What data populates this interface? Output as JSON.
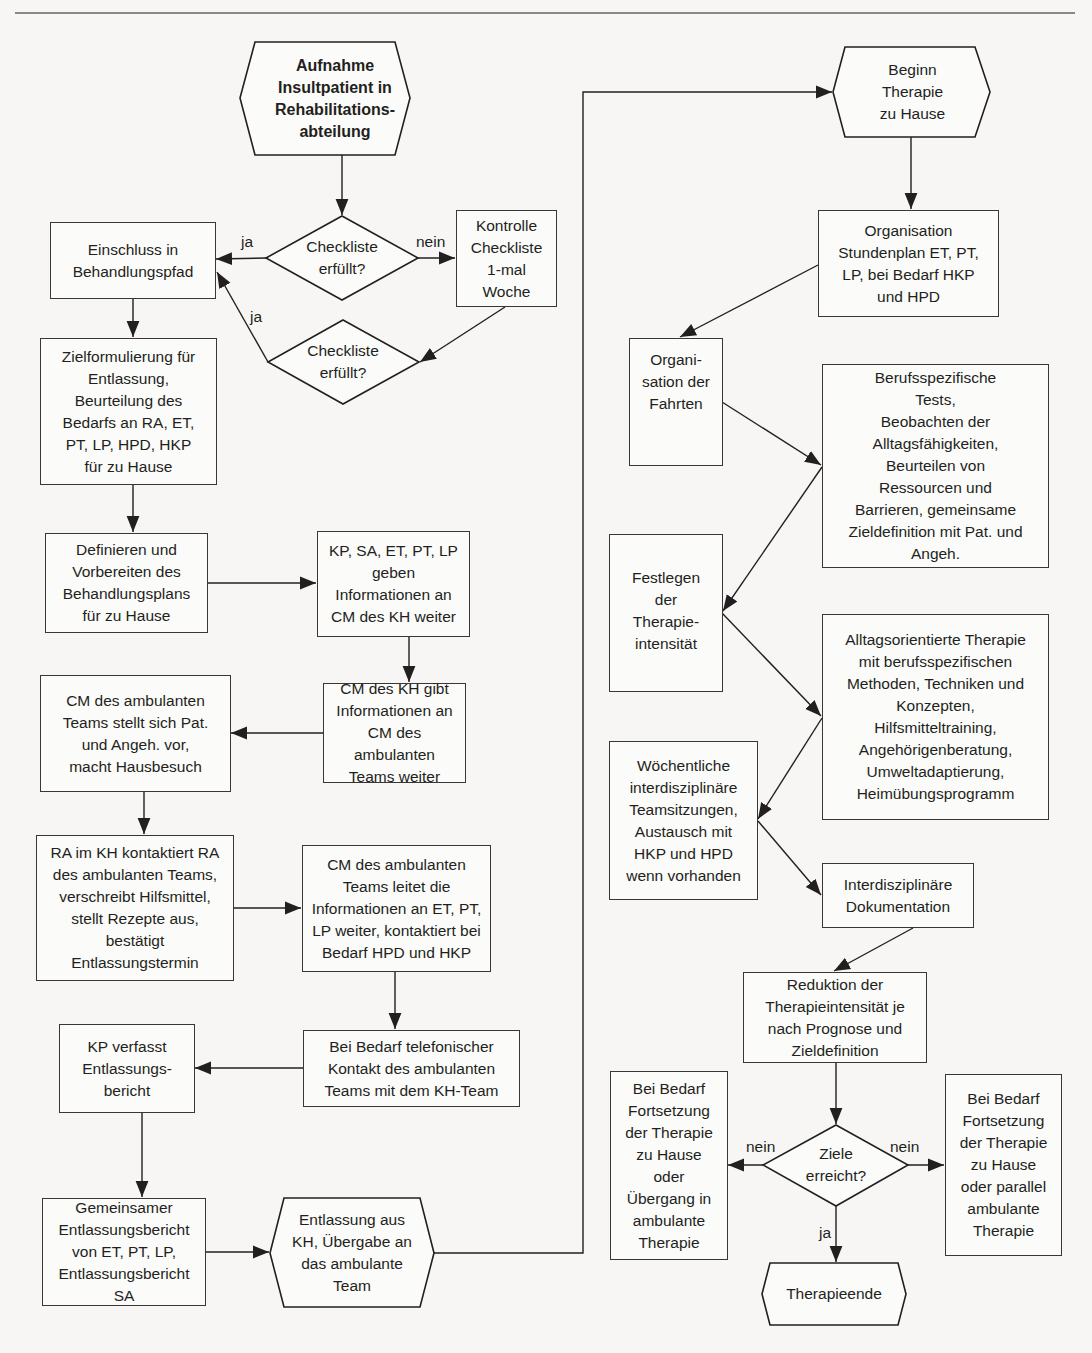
{
  "colors": {
    "line": "#231f20",
    "box_fill": "#fbfbfa",
    "background": "#f7f6f4",
    "rule": "#8a8886"
  },
  "left_column": {
    "start": "Aufnahme\nInsultpatient in\nRehabilitations-\nabteilung",
    "decision_1": "Checkliste\nerfüllt?",
    "control": "Kontrolle\nCheckliste\n1-mal\nWoche",
    "decision_2": "Checkliste\nerfüllt?",
    "inclusion": "Einschluss in\nBehandlungspfad",
    "goal_formulation": "Zielformulierung für\nEntlassung,\nBeurteilung des\nBedarfs an RA, ET,\nPT, LP, HPD, HKP\nfür zu Hause",
    "define_plan": "Definieren und\nVorbereiten des\nBehandlungsplans\nfür zu Hause",
    "info_to_cm": "KP, SA, ET, PT, LP\ngeben\nInformationen an\nCM des KH weiter",
    "cm_kh_info": "CM des KH gibt\nInformationen an\nCM des ambulanten\nTeams weiter",
    "cm_amb_visit": "CM des ambulanten\nTeams stellt sich Pat.\nund Angeh. vor,\nmacht Hausbesuch",
    "ra_contact": "RA im KH kontaktiert RA\ndes ambulanten Teams,\nverschreibt Hilfsmittel,\nstellt Rezepte aus,\nbestätigt\nEntlassungstermin",
    "cm_amb_forward": "CM des ambulanten\nTeams leitet die\nInformationen an ET, PT,\nLP weiter, kontaktiert bei\nBedarf HPD und HKP",
    "kp_report": "KP verfasst\nEntlassungs-\nbericht",
    "phone_contact": "Bei Bedarf telefonischer\nKontakt des ambulanten\nTeams mit dem KH-Team",
    "joint_report": "Gemeinsamer\nEntlassungsbericht\nvon ET, PT, LP,\nEntlassungsbericht SA",
    "discharge": "Entlassung aus\nKH, Übergabe an\ndas ambulante\nTeam"
  },
  "right_column": {
    "therapy_start": "Beginn\nTherapie\nzu Hause",
    "schedule": "Organisation\nStundenplan ET, PT,\nLP, bei Bedarf HKP\nund HPD",
    "transport": "Organi-\nsation der\nFahrten",
    "assessment": "Berufsspezifische\nTests,\nBeobachten der\nAlltagsfähigkeiten,\nBeurteilen von\nRessourcen und\nBarrieren, gemeinsame\nZieldefinition mit Pat. und\nAngeh.",
    "intensity": "Festlegen\nder\nTherapie-\nintensität",
    "therapy": "Alltagsorientierte Therapie\nmit berufsspezifischen\nMethoden, Techniken und\nKonzepten,\nHilfsmitteltraining,\nAngehörigenberatung,\nUmweltadaptierung,\nHeimübungsprogramm",
    "team_meetings": "Wöchentliche\ninterdisziplinäre\nTeamsitzungen,\nAustausch mit\nHKP und HPD\nwenn vorhanden",
    "documentation": "Interdisziplinäre\nDokumentation",
    "reduction": "Reduktion der\nTherapieintensität je\nnach Prognose und\nZieldefinition",
    "goals_decision": "Ziele\nerreicht?",
    "continue_left": "Bei Bedarf\nFortsetzung\nder Therapie\nzu Hause\noder\nÜbergang in\nambulante\nTherapie",
    "continue_right": "Bei Bedarf\nFortsetzung\nder Therapie\nzu Hause\noder parallel\nambulante\nTherapie",
    "end": "Therapieende"
  },
  "edge_labels": {
    "d1_yes": "ja",
    "d1_no": "nein",
    "d2_yes": "ja",
    "goals_no_left": "nein",
    "goals_no_right": "nein",
    "goals_yes": "ja"
  }
}
